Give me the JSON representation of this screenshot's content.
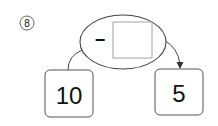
{
  "problem": {
    "number_label": "8",
    "number_glyph": "⑧"
  },
  "operation": {
    "operator": "−",
    "answer_box_value": ""
  },
  "start_value": "10",
  "result_value": "5",
  "colors": {
    "stroke": "#444444",
    "text": "#111111",
    "box_stroke": "#999999",
    "background": "#ffffff"
  }
}
